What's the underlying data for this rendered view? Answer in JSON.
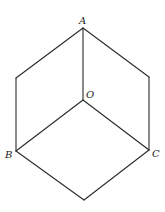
{
  "diagram": {
    "labels": {
      "A": "A",
      "O": "O",
      "B": "B",
      "C": "C"
    },
    "vertices": {
      "A": [
        83,
        28
      ],
      "upper_left": [
        16,
        78
      ],
      "upper_right": [
        149,
        77
      ],
      "O": [
        83,
        100
      ],
      "B": [
        16,
        151
      ],
      "C": [
        149,
        150
      ],
      "bottom": [
        84,
        200
      ]
    },
    "edges": [
      [
        "A",
        "upper_left"
      ],
      [
        "A",
        "upper_right"
      ],
      [
        "A",
        "O"
      ],
      [
        "upper_left",
        "B"
      ],
      [
        "upper_right",
        "C"
      ],
      [
        "O",
        "B"
      ],
      [
        "O",
        "C"
      ],
      [
        "B",
        "bottom"
      ],
      [
        "C",
        "bottom"
      ]
    ],
    "colors": {
      "line": "#2a2a2a",
      "text": "#222222",
      "background": "#ffffff"
    }
  }
}
